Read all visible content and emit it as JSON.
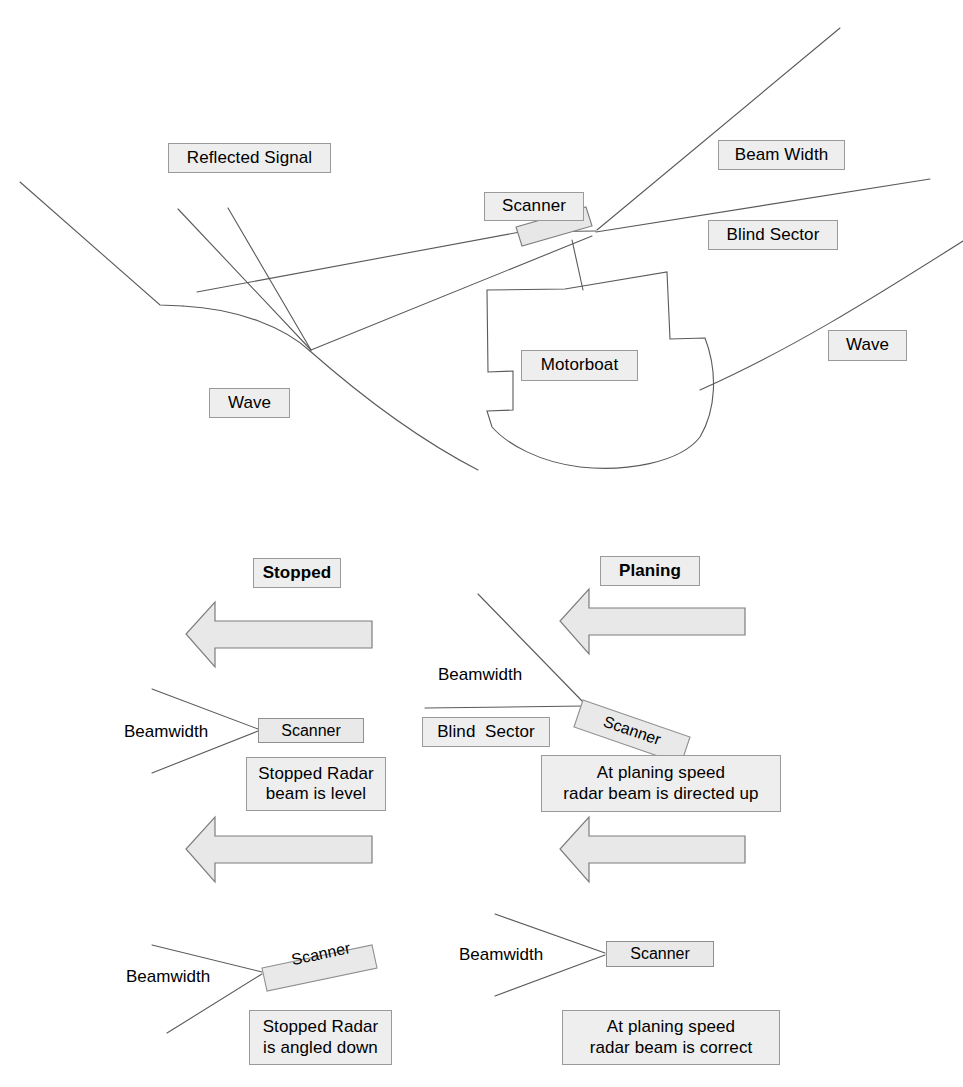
{
  "diagram": {
    "colors": {
      "label_fill": "#eeeeee",
      "label_border": "#9a9a9a",
      "arrow_fill": "#e8e8e8",
      "arrow_border": "#7d7d7d",
      "line": "#555555",
      "scanner_fill": "#e9e9e9"
    }
  },
  "top_scene": {
    "labels": {
      "reflected_signal": "Reflected Signal",
      "beam_width": "Beam Width",
      "scanner": "Scanner",
      "blind_sector": "Blind Sector",
      "motorboat": "Motorboat",
      "wave_left": "Wave",
      "wave_right": "Wave"
    }
  },
  "panels": [
    {
      "id": "stopped-level",
      "heading": "Stopped",
      "beamwidth_label": "Beamwidth",
      "scanner_label": "Scanner",
      "caption": "Stopped Radar\nbeam is level",
      "caption_line1": "Stopped Radar",
      "caption_line2": "beam is level",
      "arrow_direction": "left",
      "scanner_tilt_deg": 0
    },
    {
      "id": "planing-up",
      "heading": "Planing",
      "beamwidth_label": "Beamwidth",
      "scanner_label": "Scanner",
      "blind_sector_label": "Blind  Sector",
      "caption": "At planing speed\nradar beam is directed up",
      "caption_line1": "At planing speed",
      "caption_line2": "radar beam is directed up",
      "arrow_direction": "left",
      "scanner_tilt_deg": 20
    },
    {
      "id": "stopped-angled-down",
      "heading": "",
      "beamwidth_label": "Beamwidth",
      "scanner_label": "Scanner",
      "caption": "Stopped Radar\nis angled down",
      "caption_line1": "Stopped Radar",
      "caption_line2": "is angled down",
      "arrow_direction": "left",
      "scanner_tilt_deg": -12
    },
    {
      "id": "planing-correct",
      "heading": "",
      "beamwidth_label": "Beamwidth",
      "scanner_label": "Scanner",
      "caption": "At planing speed\nradar beam is correct",
      "caption_line1": "At planing speed",
      "caption_line2": "radar beam is correct",
      "arrow_direction": "left",
      "scanner_tilt_deg": 0
    }
  ]
}
